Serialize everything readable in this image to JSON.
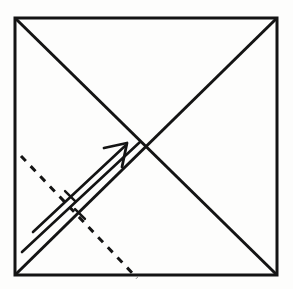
{
  "figure": {
    "canvas": {
      "width": 293,
      "height": 289
    },
    "colors": {
      "background": "#fdfdfc",
      "stroke": "#141414",
      "dashed_stroke": "#141414"
    },
    "stroke_widths": {
      "square": 3.0,
      "diagonal": 3.0,
      "dashed": 3.0,
      "arrow": 2.6,
      "tick": 2.4
    }
  },
  "square": {
    "label": "paper-square",
    "corners": {
      "top_left": {
        "x": 15,
        "y": 18
      },
      "top_right": {
        "x": 277,
        "y": 18
      },
      "bottom_right": {
        "x": 277,
        "y": 275
      },
      "bottom_left": {
        "x": 15,
        "y": 275
      }
    }
  },
  "diagonals": [
    {
      "label": "diagonal-tl-br",
      "from": {
        "x": 15,
        "y": 18
      },
      "to": {
        "x": 277,
        "y": 275
      }
    },
    {
      "label": "diagonal-bl-tr",
      "from": {
        "x": 15,
        "y": 275
      },
      "to": {
        "x": 277,
        "y": 18
      }
    }
  ],
  "intersection": {
    "x": 146,
    "y": 147
  },
  "dashed_line": {
    "label": "fold-crease-line",
    "from": {
      "x": 21,
      "y": 156
    },
    "to": {
      "x": 137,
      "y": 278
    },
    "dash": 7,
    "gap": 7
  },
  "arrow": {
    "label": "fold-direction-arrow",
    "shaft_upper": {
      "from": {
        "x": 33,
        "y": 232
      },
      "to": {
        "x": 125,
        "y": 146
      }
    },
    "shaft_lower": {
      "from": {
        "x": 22,
        "y": 252
      },
      "to": {
        "x": 140,
        "y": 142
      }
    },
    "head": {
      "tip": {
        "x": 127,
        "y": 143
      },
      "barb_left": {
        "x": 104,
        "y": 148
      },
      "barb_down": {
        "x": 122,
        "y": 167
      }
    },
    "ticks": [
      {
        "label": "tick-upper-shaft",
        "cx": 70,
        "cy": 196,
        "len": 14
      },
      {
        "label": "tick-lower-shaft",
        "cx": 80,
        "cy": 214,
        "len": 14
      }
    ]
  }
}
